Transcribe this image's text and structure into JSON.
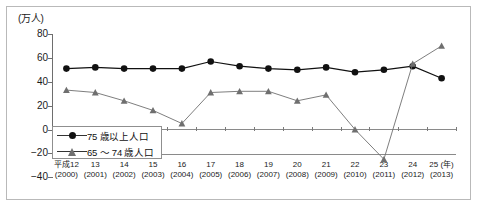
{
  "chart_data": {
    "type": "line",
    "title": "",
    "subtitle": "",
    "unit_label": "(万人)",
    "xlabel": "(年)",
    "ylabel": "",
    "grid": false,
    "legend_position": "inside-bottom-left",
    "ylim": [
      -40,
      80
    ],
    "yticks": [
      80,
      60,
      40,
      20,
      0,
      -20,
      -40
    ],
    "categories": [
      "平成12\n(2000)",
      "13\n(2001)",
      "14\n(2002)",
      "15\n(2003)",
      "16\n(2004)",
      "17\n(2005)",
      "18\n(2006)",
      "19\n(2007)",
      "20\n(2008)",
      "21\n(2009)",
      "22\n(2010)",
      "23\n(2011)",
      "24\n(2012)",
      "25\n(2013)"
    ],
    "x_labels_era": [
      "平成12",
      "13",
      "14",
      "15",
      "16",
      "17",
      "18",
      "19",
      "20",
      "21",
      "22",
      "23",
      "24",
      "25"
    ],
    "x_labels_year": [
      "(2000)",
      "(2001)",
      "(2002)",
      "(2003)",
      "(2004)",
      "(2005)",
      "(2006)",
      "(2007)",
      "(2008)",
      "(2009)",
      "(2010)",
      "(2011)",
      "(2012)",
      "(2013)"
    ],
    "series": [
      {
        "name": "75 歳以上人口",
        "marker": "circle",
        "color": "#111111",
        "values": [
          51,
          52,
          51,
          51,
          51,
          57,
          53,
          51,
          50,
          52,
          48,
          50,
          53,
          43
        ]
      },
      {
        "name": "65 ～ 74 歳人口",
        "marker": "triangle",
        "color": "#6f6f6f",
        "values": [
          33,
          31,
          24,
          16,
          5,
          31,
          32,
          32,
          24,
          29,
          0,
          -25,
          55,
          70
        ]
      }
    ]
  },
  "legend": {
    "items": [
      {
        "label": "75 歳以上人口"
      },
      {
        "label": "65 ～ 74 歳人口"
      }
    ]
  },
  "axis": {
    "unit": "(万人)",
    "year_suffix": "(年)"
  }
}
